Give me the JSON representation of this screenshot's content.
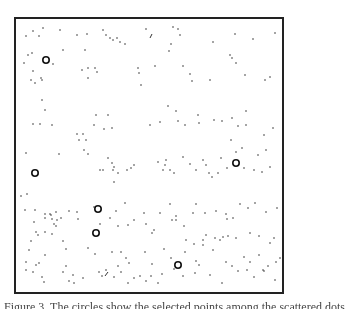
{
  "figure": {
    "frame": {
      "x": 15,
      "y": 18,
      "w": 268,
      "h": 275,
      "stroke": "#222222"
    },
    "dot_color": "#333333",
    "circle_color": "#111111",
    "circles": [
      {
        "x": 46,
        "y": 60
      },
      {
        "x": 35,
        "y": 173
      },
      {
        "x": 98,
        "y": 209
      },
      {
        "x": 96,
        "y": 233
      },
      {
        "x": 178,
        "y": 265
      },
      {
        "x": 236,
        "y": 163
      }
    ],
    "dots": [
      [
        26,
        36
      ],
      [
        33,
        31
      ],
      [
        39,
        36
      ],
      [
        43,
        28
      ],
      [
        60,
        30
      ],
      [
        77,
        35
      ],
      [
        87,
        34
      ],
      [
        103,
        30
      ],
      [
        106,
        35
      ],
      [
        110,
        38
      ],
      [
        113,
        40
      ],
      [
        117,
        38
      ],
      [
        120,
        42
      ],
      [
        125,
        44
      ],
      [
        146,
        29
      ],
      [
        173,
        27
      ],
      [
        178,
        29
      ],
      [
        180,
        35
      ],
      [
        171,
        44
      ],
      [
        169,
        51
      ],
      [
        213,
        42
      ],
      [
        235,
        34
      ],
      [
        253,
        39
      ],
      [
        275,
        33
      ],
      [
        28,
        55
      ],
      [
        32,
        53
      ],
      [
        24,
        63
      ],
      [
        33,
        71
      ],
      [
        41,
        78
      ],
      [
        31,
        80
      ],
      [
        35,
        83
      ],
      [
        42,
        80
      ],
      [
        53,
        64
      ],
      [
        63,
        50
      ],
      [
        82,
        70
      ],
      [
        85,
        50
      ],
      [
        88,
        68
      ],
      [
        95,
        68
      ],
      [
        97,
        72
      ],
      [
        88,
        78
      ],
      [
        138,
        68
      ],
      [
        139,
        73
      ],
      [
        155,
        66
      ],
      [
        183,
        66
      ],
      [
        190,
        74
      ],
      [
        192,
        81
      ],
      [
        210,
        80
      ],
      [
        230,
        55
      ],
      [
        232,
        58
      ],
      [
        236,
        63
      ],
      [
        245,
        75
      ],
      [
        265,
        80
      ],
      [
        270,
        77
      ],
      [
        141,
        85
      ],
      [
        42,
        100
      ],
      [
        45,
        110
      ],
      [
        33,
        124
      ],
      [
        40,
        124
      ],
      [
        52,
        125
      ],
      [
        77,
        134
      ],
      [
        83,
        134
      ],
      [
        79,
        140
      ],
      [
        86,
        140
      ],
      [
        84,
        150
      ],
      [
        94,
        125
      ],
      [
        96,
        115
      ],
      [
        104,
        129
      ],
      [
        108,
        115
      ],
      [
        112,
        128
      ],
      [
        150,
        125
      ],
      [
        160,
        122
      ],
      [
        168,
        106
      ],
      [
        176,
        111
      ],
      [
        178,
        121
      ],
      [
        185,
        125
      ],
      [
        198,
        115
      ],
      [
        199,
        123
      ],
      [
        214,
        120
      ],
      [
        222,
        121
      ],
      [
        232,
        118
      ],
      [
        238,
        126
      ],
      [
        246,
        111
      ],
      [
        246,
        125
      ],
      [
        273,
        128
      ],
      [
        231,
        140
      ],
      [
        236,
        152
      ],
      [
        242,
        148
      ],
      [
        258,
        155
      ],
      [
        266,
        150
      ],
      [
        264,
        135
      ],
      [
        26,
        153
      ],
      [
        59,
        154
      ],
      [
        88,
        154
      ],
      [
        108,
        158
      ],
      [
        112,
        163
      ],
      [
        114,
        167
      ],
      [
        113,
        170
      ],
      [
        118,
        173
      ],
      [
        100,
        170
      ],
      [
        103,
        170
      ],
      [
        114,
        182
      ],
      [
        127,
        170
      ],
      [
        131,
        168
      ],
      [
        134,
        165
      ],
      [
        166,
        160
      ],
      [
        165,
        165
      ],
      [
        170,
        170
      ],
      [
        158,
        162
      ],
      [
        163,
        170
      ],
      [
        174,
        173
      ],
      [
        183,
        157
      ],
      [
        190,
        164
      ],
      [
        196,
        170
      ],
      [
        203,
        160
      ],
      [
        206,
        165
      ],
      [
        209,
        173
      ],
      [
        212,
        177
      ],
      [
        218,
        173
      ],
      [
        227,
        168
      ],
      [
        221,
        158
      ],
      [
        244,
        168
      ],
      [
        254,
        170
      ],
      [
        262,
        172
      ],
      [
        270,
        167
      ],
      [
        21,
        196
      ],
      [
        27,
        194
      ],
      [
        25,
        210
      ],
      [
        35,
        210
      ],
      [
        45,
        214
      ],
      [
        51,
        215
      ],
      [
        52,
        219
      ],
      [
        56,
        212
      ],
      [
        57,
        220
      ],
      [
        69,
        211
      ],
      [
        77,
        212
      ],
      [
        78,
        219
      ],
      [
        94,
        207
      ],
      [
        116,
        211
      ],
      [
        125,
        203
      ],
      [
        160,
        213
      ],
      [
        170,
        204
      ],
      [
        172,
        220
      ],
      [
        176,
        220
      ],
      [
        193,
        213
      ],
      [
        196,
        204
      ],
      [
        205,
        213
      ],
      [
        216,
        211
      ],
      [
        226,
        214
      ],
      [
        227,
        219
      ],
      [
        233,
        218
      ],
      [
        240,
        204
      ],
      [
        248,
        208
      ],
      [
        255,
        203
      ],
      [
        266,
        212
      ],
      [
        277,
        208
      ],
      [
        34,
        222
      ],
      [
        45,
        218
      ],
      [
        36,
        232
      ],
      [
        38,
        235
      ],
      [
        45,
        232
      ],
      [
        52,
        234
      ],
      [
        56,
        226
      ],
      [
        50,
        214
      ],
      [
        61,
        218
      ],
      [
        54,
        224
      ],
      [
        100,
        224
      ],
      [
        110,
        218
      ],
      [
        118,
        226
      ],
      [
        128,
        225
      ],
      [
        134,
        220
      ],
      [
        144,
        213
      ],
      [
        146,
        224
      ],
      [
        152,
        233
      ],
      [
        154,
        230
      ],
      [
        176,
        216
      ],
      [
        184,
        226
      ],
      [
        186,
        240
      ],
      [
        194,
        244
      ],
      [
        203,
        240
      ],
      [
        206,
        235
      ],
      [
        215,
        238
      ],
      [
        220,
        240
      ],
      [
        223,
        237
      ],
      [
        228,
        236
      ],
      [
        236,
        238
      ],
      [
        250,
        233
      ],
      [
        259,
        236
      ],
      [
        270,
        243
      ],
      [
        274,
        238
      ],
      [
        29,
        250
      ],
      [
        31,
        241
      ],
      [
        26,
        262
      ],
      [
        45,
        255
      ],
      [
        63,
        241
      ],
      [
        66,
        249
      ],
      [
        88,
        248
      ],
      [
        95,
        254
      ],
      [
        112,
        252
      ],
      [
        121,
        252
      ],
      [
        126,
        258
      ],
      [
        129,
        263
      ],
      [
        145,
        252
      ],
      [
        152,
        264
      ],
      [
        164,
        249
      ],
      [
        171,
        258
      ],
      [
        185,
        252
      ],
      [
        196,
        261
      ],
      [
        199,
        265
      ],
      [
        203,
        245
      ],
      [
        213,
        250
      ],
      [
        226,
        262
      ],
      [
        244,
        257
      ],
      [
        250,
        262
      ],
      [
        259,
        255
      ],
      [
        263,
        270
      ],
      [
        276,
        262
      ],
      [
        280,
        258
      ],
      [
        26,
        270
      ],
      [
        33,
        272
      ],
      [
        36,
        265
      ],
      [
        39,
        263
      ],
      [
        42,
        277
      ],
      [
        44,
        282
      ],
      [
        63,
        272
      ],
      [
        66,
        266
      ],
      [
        69,
        281
      ],
      [
        73,
        275
      ],
      [
        74,
        283
      ],
      [
        83,
        278
      ],
      [
        99,
        272
      ],
      [
        102,
        276
      ],
      [
        106,
        270
      ],
      [
        114,
        277
      ],
      [
        118,
        266
      ],
      [
        121,
        272
      ],
      [
        128,
        283
      ],
      [
        134,
        278
      ],
      [
        140,
        276
      ],
      [
        146,
        281
      ],
      [
        151,
        276
      ],
      [
        158,
        283
      ],
      [
        162,
        274
      ],
      [
        174,
        269
      ],
      [
        183,
        276
      ],
      [
        195,
        273
      ],
      [
        210,
        275
      ],
      [
        222,
        283
      ],
      [
        232,
        266
      ],
      [
        238,
        271
      ],
      [
        247,
        270
      ],
      [
        254,
        277
      ],
      [
        264,
        271
      ],
      [
        268,
        266
      ],
      [
        275,
        280
      ]
    ],
    "strokes": [
      [
        105,
        276,
        108,
        272
      ],
      [
        150,
        38,
        152,
        34
      ]
    ]
  },
  "caption": {
    "text": "Figure 3. The circles show the selected points among the scattered dots"
  }
}
